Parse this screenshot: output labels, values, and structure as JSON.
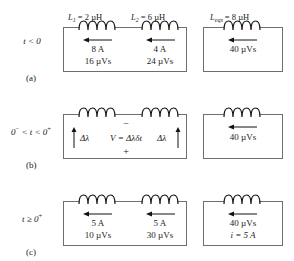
{
  "figure": {
    "line_color": "#6e6e6e",
    "text_color": "#1a1a1a",
    "background": "#ffffff"
  },
  "rows": [
    {
      "id": "a",
      "caption": "(a)",
      "time_label": "t < 0",
      "left_box": {
        "inductors": [
          {
            "label_prefix": "L",
            "label_sub": "1",
            "label_value": " = 2 µH",
            "label_full": "L1 = 2 µH",
            "arrow": "left",
            "values": [
              "8 A",
              "16 µVs"
            ]
          },
          {
            "label_prefix": "L",
            "label_sub": "2",
            "label_value": " = 6 µH",
            "label_full": "L2 = 6 µH",
            "arrow": "left",
            "values": [
              "4 A",
              "24 µVs"
            ]
          }
        ]
      },
      "right_box": {
        "inductor": {
          "label_prefix": "L",
          "label_sub": "eqs",
          "label_value": " = 8 µH",
          "label_full": "Leqs = 8 µH",
          "arrow": "left",
          "values": [
            "40 µVs"
          ]
        }
      }
    },
    {
      "id": "b",
      "caption": "(b)",
      "time_label": "0− < t < 0+",
      "time_label_pre": "0",
      "time_label_sup1": "−",
      "time_label_mid": " < t < 0",
      "time_label_sup2": "+",
      "left_box": {
        "flux_left": "Δλ",
        "flux_right": "Δλ",
        "equation": "V = Δλδt",
        "polarity_top": "−",
        "polarity_bottom": "+"
      },
      "right_box": {
        "inductor": {
          "arrow": "left",
          "values": [
            "40 µVs"
          ]
        }
      }
    },
    {
      "id": "c",
      "caption": "(c)",
      "time_label": "t ≥ 0+",
      "time_label_pre": "t ≥ 0",
      "time_label_sup": "+",
      "left_box": {
        "inductors": [
          {
            "arrow": "left",
            "values": [
              "5 A",
              "10 µVs"
            ]
          },
          {
            "arrow": "left",
            "values": [
              "5 A",
              "30 µVs"
            ]
          }
        ]
      },
      "right_box": {
        "inductor": {
          "arrow": "left",
          "values": [
            "40 µVs",
            "i = 5 A"
          ]
        }
      }
    }
  ]
}
